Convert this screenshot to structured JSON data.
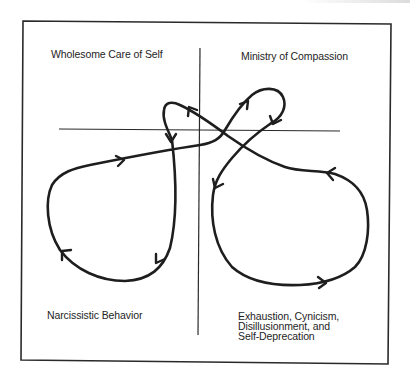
{
  "diagram": {
    "quadrants": {
      "top_left": {
        "label": "Wholesome Care of Self"
      },
      "top_right": {
        "label": "Ministry of Compassion"
      },
      "bottom_left": {
        "label": "Narcissistic Behavior"
      },
      "bottom_right": {
        "label_lines": [
          "Exhaustion, Cynicism,",
          "Disillusionment, and",
          "Self-Deprecation"
        ]
      }
    },
    "colors": {
      "ink": "#1e1e1e",
      "frame": "#2a2a2a",
      "background": "#ffffff"
    },
    "elements": {
      "frame": "rectangular border",
      "axes": [
        "vertical axis",
        "horizontal axis"
      ],
      "curves": [
        "figure-eight loop path with directional arrows"
      ]
    }
  }
}
